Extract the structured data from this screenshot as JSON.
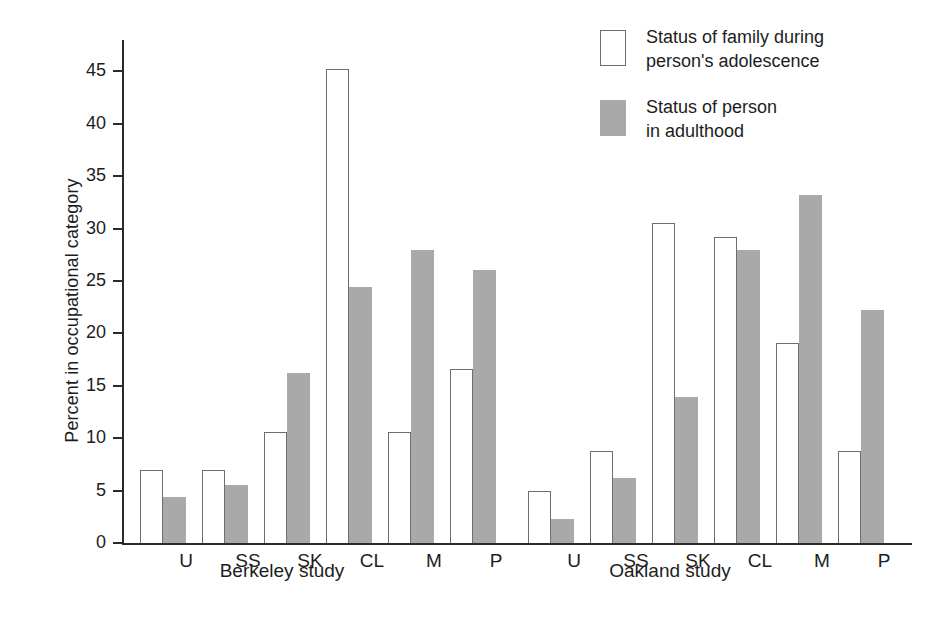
{
  "chart_data": {
    "type": "bar",
    "title": "",
    "xlabel": "",
    "ylabel": "Percent in occupational category",
    "ylim": [
      0,
      48
    ],
    "yticks": [
      0,
      5,
      10,
      15,
      20,
      25,
      30,
      35,
      40,
      45
    ],
    "grid": false,
    "legend_position": "top-right",
    "categories": [
      "U",
      "SS",
      "SK",
      "CL",
      "M",
      "P"
    ],
    "groups": [
      {
        "name": "Berkeley study",
        "series": [
          {
            "name": "Status of family during person's adolescence",
            "values": [
              7.0,
              7.0,
              10.6,
              45.2,
              10.6,
              16.6
            ]
          },
          {
            "name": "Status of person in adulthood",
            "values": [
              4.4,
              5.5,
              16.2,
              24.4,
              28.0,
              26.1
            ]
          }
        ]
      },
      {
        "name": "Oakland study",
        "series": [
          {
            "name": "Status of family during person's adolescence",
            "values": [
              5.0,
              8.8,
              30.5,
              29.2,
              19.1,
              8.8
            ]
          },
          {
            "name": "Status of person in adulthood",
            "values": [
              2.3,
              6.2,
              13.9,
              28.0,
              33.2,
              22.2
            ]
          }
        ]
      }
    ],
    "colors": {
      "open_fill": "#ffffff",
      "open_border": "#6e6e6e",
      "filled": "#a9a9a9",
      "axis": "#2b2b2b",
      "text": "#1d1d1d"
    }
  },
  "axis": {
    "y_title": "Percent in occupational category",
    "y_tick_labels": [
      "0",
      "5",
      "10",
      "15",
      "20",
      "25",
      "30",
      "35",
      "40",
      "45"
    ]
  },
  "legend": {
    "items": [
      {
        "swatch": "open",
        "label": "Status of family during\nperson's adolescence"
      },
      {
        "swatch": "filled",
        "label": "Status of person\nin adulthood"
      }
    ]
  },
  "x_labels": {
    "berkeley": [
      "U",
      "SS",
      "SK",
      "CL",
      "M",
      "P"
    ],
    "oakland": [
      "U",
      "SS",
      "SK",
      "CL",
      "M",
      "P"
    ]
  },
  "group_labels": {
    "left": "Berkeley study",
    "right": "Oakland study"
  }
}
